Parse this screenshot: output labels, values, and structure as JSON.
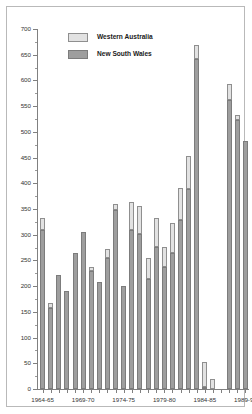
{
  "chart_data": {
    "type": "bar",
    "title": "",
    "subtitle": "",
    "xlabel": "",
    "ylabel": "",
    "grid": false,
    "stacked": true,
    "legend_position": "top-left",
    "ylim": [
      0,
      700
    ],
    "ytick_step": 50,
    "ytick_labels": [
      "0",
      "50",
      "100",
      "150",
      "200",
      "250",
      "300",
      "350",
      "400",
      "450",
      "500",
      "550",
      "600",
      "650",
      "700"
    ],
    "ytick_values": [
      0,
      50,
      100,
      150,
      200,
      250,
      300,
      350,
      400,
      450,
      500,
      550,
      600,
      650,
      700
    ],
    "categories": [
      "1964-65",
      "1965-66",
      "1966-67",
      "1967-68",
      "1968-69",
      "1969-70",
      "1970-71",
      "1971-72",
      "1972-73",
      "1973-74",
      "1974-75",
      "1975-76",
      "1976-77",
      "1977-78",
      "1978-79",
      "1979-80",
      "1980-81",
      "1981-82",
      "1982-83",
      "1983-84",
      "1984-85",
      "1985-86",
      "1986-87",
      "1987-88",
      "1988-89",
      "1989-90"
    ],
    "xtick_labels": [
      "1964-65",
      "1969-70",
      "1974-75",
      "1979-80",
      "1984-85",
      "1989-90"
    ],
    "xtick_indices": [
      0,
      5,
      10,
      15,
      20,
      25
    ],
    "series": [
      {
        "name": "New South Wales",
        "color": "#9e9e9e",
        "values": [
          310,
          158,
          222,
          190,
          264,
          306,
          230,
          208,
          254,
          348,
          201,
          309,
          302,
          214,
          276,
          237,
          264,
          328,
          388,
          642,
          3,
          0,
          0,
          562,
          524,
          482
        ]
      },
      {
        "name": "Western Australia",
        "color": "#e2e2e2",
        "values": [
          22,
          10,
          0,
          0,
          0,
          0,
          8,
          0,
          18,
          12,
          0,
          54,
          54,
          40,
          56,
          39,
          59,
          62,
          66,
          26,
          50,
          20,
          0,
          32,
          8,
          0
        ]
      }
    ],
    "totals": [
      332,
      168,
      222,
      190,
      264,
      306,
      238,
      208,
      272,
      360,
      201,
      363,
      356,
      254,
      332,
      276,
      323,
      390,
      454,
      668,
      53,
      20,
      0,
      594,
      532,
      482
    ]
  },
  "legend": {
    "items": [
      {
        "label": "Western Australia"
      },
      {
        "label": "New South Wales"
      }
    ]
  }
}
